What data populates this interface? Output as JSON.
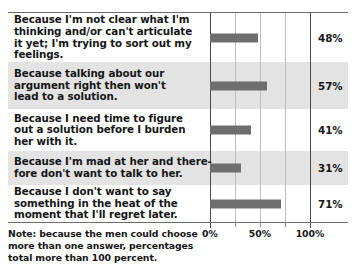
{
  "chart_data": {
    "type": "bar",
    "orientation": "horizontal",
    "title": "",
    "xlabel": "",
    "ylabel": "",
    "xlim": [
      0,
      125
    ],
    "grid": true,
    "legend": false,
    "categories": [
      "Because I'm not clear what I'm thinking and/or can't articulate it yet; I'm trying to sort out my feelings.",
      "Because talking about our argument right then won't lead to a solution.",
      "Because I need time to figure out a solution before I burden her with it.",
      "Because I'm mad at her and therefore don't want to talk to her.",
      "Because I don't want to say something in the heat of the moment that I'll regret later."
    ],
    "values": [
      48,
      57,
      41,
      31,
      71
    ],
    "value_labels": [
      "48%",
      "57%",
      "41%",
      "31%",
      "71%"
    ],
    "tick_values": [
      0,
      25,
      50,
      75,
      100
    ],
    "tick_labels": [
      "0%",
      "",
      "50%",
      "",
      "100%"
    ],
    "bar_color": "#6e6e6e",
    "alt_row_color": "#e3e3e3",
    "gridline_color": "#bdbdbd",
    "axis_color": "#4a4a4a"
  },
  "rows": [
    {
      "lines": [
        "Because I'm not clear what I'm",
        "thinking and/or can't articulate",
        "it yet; I'm trying to sort out my",
        "feelings."
      ],
      "value": "48%",
      "pct": 48,
      "height": 49,
      "shaded": false
    },
    {
      "lines": [
        "Because talking about our",
        "argument right then won't",
        "lead to a solution."
      ],
      "value": "57%",
      "pct": 57,
      "height": 47,
      "shaded": true
    },
    {
      "lines": [
        "Because I need time to figure",
        "out a solution before I burden",
        "her with it."
      ],
      "value": "41%",
      "pct": 41,
      "height": 42,
      "shaded": false
    },
    {
      "lines": [
        "Because I'm mad at her and there-",
        "fore don't want to talk to her."
      ],
      "value": "31%",
      "pct": 31,
      "height": 34,
      "shaded": true
    },
    {
      "lines": [
        "Because I don't want to say",
        "something in the heat of the",
        "moment that I'll regret later."
      ],
      "value": "71%",
      "pct": 71,
      "height": 37,
      "shaded": false
    }
  ],
  "axis": {
    "ticks": [
      {
        "pct": 0,
        "label": "0%",
        "major": true
      },
      {
        "pct": 25,
        "label": "",
        "major": false
      },
      {
        "pct": 50,
        "label": "50%",
        "major": false
      },
      {
        "pct": 75,
        "label": "",
        "major": false
      },
      {
        "pct": 100,
        "label": "100%",
        "major": true
      }
    ]
  },
  "note": {
    "lines": [
      "Note: because the men could choose",
      "more than one answer, percentages",
      "total more than 100 percent."
    ]
  }
}
